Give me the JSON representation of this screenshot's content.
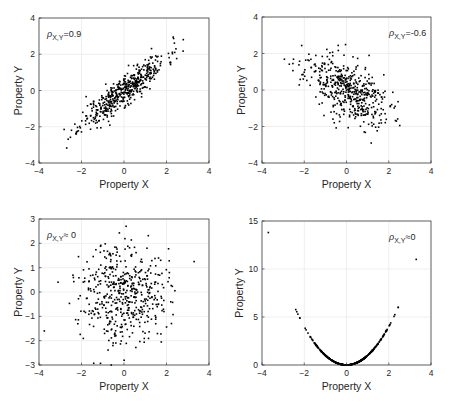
{
  "figure": {
    "width": 450,
    "height": 405,
    "background": "#ffffff",
    "axis_color": "#262626",
    "grid_color": "#ebebeb",
    "point_color": "#000000"
  },
  "chart_data": [
    {
      "id": "top-left",
      "type": "scatter",
      "title": "",
      "xlabel": "Property X",
      "ylabel": "Property Y",
      "xlim": [
        -4,
        4
      ],
      "ylim": [
        -4,
        4
      ],
      "xticks": [
        -4,
        -2,
        0,
        2,
        4
      ],
      "yticks": [
        -4,
        -2,
        0,
        2,
        4
      ],
      "grid": true,
      "annotation": {
        "symbol": "ρ",
        "subscript": "X,Y",
        "text": "=0.9",
        "position": "top-left"
      },
      "box": {
        "x0": 39,
        "y0": 18,
        "x1": 209,
        "y1": 163
      },
      "series": [
        {
          "name": "samples",
          "n": 500,
          "distribution": "bivariate-normal",
          "correlation": 0.9,
          "sd_x": 1,
          "sd_y": 1,
          "seed": 11
        }
      ]
    },
    {
      "id": "top-right",
      "type": "scatter",
      "title": "",
      "xlabel": "Property X",
      "ylabel": "Property Y",
      "xlim": [
        -4,
        4
      ],
      "ylim": [
        -4,
        4
      ],
      "xticks": [
        -4,
        -2,
        0,
        2,
        4
      ],
      "yticks": [
        -4,
        -2,
        0,
        2,
        4
      ],
      "grid": true,
      "annotation": {
        "symbol": "ρ",
        "subscript": "X,Y",
        "text": "=-0.6",
        "position": "top-right"
      },
      "box": {
        "x0": 262,
        "y0": 17,
        "x1": 431,
        "y1": 163
      },
      "series": [
        {
          "name": "samples",
          "n": 500,
          "distribution": "bivariate-normal",
          "correlation": -0.6,
          "sd_x": 1,
          "sd_y": 1,
          "seed": 23
        }
      ]
    },
    {
      "id": "bottom-left",
      "type": "scatter",
      "title": "",
      "xlabel": "Property X",
      "ylabel": "Property Y",
      "xlim": [
        -4,
        4
      ],
      "ylim": [
        -3,
        3
      ],
      "xticks": [
        -4,
        -2,
        0,
        2,
        4
      ],
      "yticks": [
        -3,
        -2,
        -1,
        0,
        1,
        2,
        3
      ],
      "grid": true,
      "annotation": {
        "symbol": "ρ",
        "subscript": "X,Y",
        "text": "≈ 0",
        "position": "top-left"
      },
      "box": {
        "x0": 39,
        "y0": 219,
        "x1": 209,
        "y1": 365
      },
      "series": [
        {
          "name": "samples",
          "n": 500,
          "distribution": "bivariate-normal",
          "correlation": 0.0,
          "sd_x": 1,
          "sd_y": 1,
          "seed": 37
        }
      ],
      "notable_points": [
        [
          3.3,
          1.25
        ],
        [
          -3.75,
          -1.6
        ],
        [
          0.1,
          2.7
        ],
        [
          -0.6,
          -3.0
        ]
      ]
    },
    {
      "id": "bottom-right",
      "type": "scatter",
      "title": "",
      "xlabel": "Property X",
      "ylabel": "Property Y",
      "xlim": [
        -4,
        4
      ],
      "ylim": [
        0,
        15
      ],
      "xticks": [
        -4,
        -2,
        0,
        2,
        4
      ],
      "yticks": [
        0,
        5,
        10,
        15
      ],
      "grid": true,
      "annotation": {
        "symbol": "ρ",
        "subscript": "X,Y",
        "text": "≈0",
        "position": "top-right"
      },
      "box": {
        "x0": 262,
        "y0": 221,
        "x1": 431,
        "y1": 365
      },
      "series": [
        {
          "name": "samples",
          "n": 500,
          "distribution": "y = x^2",
          "x_range": [
            -2.72,
            2.45
          ],
          "seed": 51
        }
      ],
      "outliers": [
        [
          -3.7,
          13.8
        ],
        [
          3.3,
          11.0
        ],
        [
          2.45,
          6.0
        ]
      ]
    }
  ]
}
